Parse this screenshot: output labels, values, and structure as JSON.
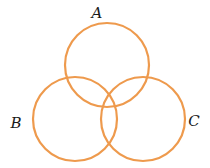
{
  "diagram": {
    "type": "venn",
    "stroke_color": "#EE9A4D",
    "sets": [
      {
        "id": "A",
        "label": "A",
        "cx": 107,
        "cy": 65,
        "r": 42,
        "label_x": 97,
        "label_y": 13
      },
      {
        "id": "B",
        "label": "B",
        "cx": 75,
        "cy": 119,
        "r": 42,
        "label_x": 16,
        "label_y": 123
      },
      {
        "id": "C",
        "label": "C",
        "cx": 143,
        "cy": 119,
        "r": 42,
        "label_x": 194,
        "label_y": 121
      }
    ]
  }
}
